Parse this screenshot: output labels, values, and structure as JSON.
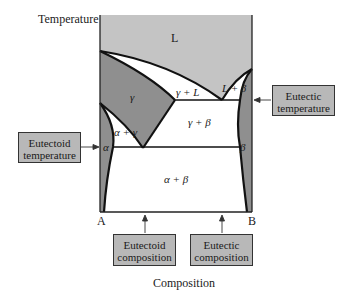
{
  "axes": {
    "y_label": "Temperature",
    "x_label": "Composition",
    "left_component": "A",
    "right_component": "B"
  },
  "regions": {
    "liquid": "L",
    "gamma": "γ",
    "gamma_plus_liquid": "γ + L",
    "liquid_plus_beta": "L + β",
    "gamma_plus_beta": "γ + β",
    "alpha_plus_gamma": "α + γ",
    "alpha": "α",
    "beta": "β",
    "alpha_plus_beta": "α + β"
  },
  "callouts": {
    "eutectoid_temperature": {
      "line1": "Eutectoid",
      "line2": "temperature"
    },
    "eutectic_temperature": {
      "line1": "Eutectic",
      "line2": "temperature"
    },
    "eutectoid_composition": {
      "line1": "Eutectoid",
      "line2": "composition"
    },
    "eutectic_composition": {
      "line1": "Eutectic",
      "line2": "composition"
    }
  },
  "colors": {
    "liquid_fill": "#c4c4c4",
    "solid_solution_fill": "#8f8f8f",
    "two_phase_fill": "#ffffff",
    "callout_fill": "#b8b8b8",
    "line": "#111111"
  }
}
